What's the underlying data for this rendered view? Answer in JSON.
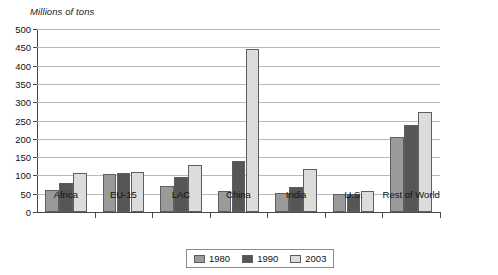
{
  "chart_data": {
    "type": "bar",
    "title": "",
    "subtitle": "",
    "xlabel": "",
    "ylabel": "Millions of tons",
    "ylim": [
      0,
      500
    ],
    "ytick_step": 50,
    "yticks": [
      0,
      50,
      100,
      150,
      200,
      250,
      300,
      350,
      400,
      450,
      500
    ],
    "ytick_labels": [
      "0",
      "50",
      "100",
      "150",
      "200",
      "250",
      "300",
      "350",
      "400",
      "450",
      "500"
    ],
    "grid": true,
    "grid_axis": "y",
    "legend_position": "bottom-center",
    "categories": [
      "Africa",
      "EU-15",
      "LAC",
      "China",
      "India",
      "U.S.",
      "Rest of World"
    ],
    "series": [
      {
        "name": "1980",
        "color": "#9a9a9a",
        "values": [
          60,
          105,
          72,
          57,
          52,
          48,
          205
        ]
      },
      {
        "name": "1990",
        "color": "#565656",
        "values": [
          79,
          107,
          96,
          140,
          67,
          49,
          237
        ]
      },
      {
        "name": "2003",
        "color": "#dcdcdc",
        "values": [
          107,
          109,
          128,
          445,
          118,
          57,
          272
        ]
      }
    ]
  },
  "legend": {
    "entries": [
      {
        "label": "1980",
        "color": "#9a9a9a"
      },
      {
        "label": "1990",
        "color": "#565656"
      },
      {
        "label": "2003",
        "color": "#dcdcdc"
      }
    ]
  },
  "colors": {
    "axis": "#4a4a4a",
    "grid": "#b9b9b9",
    "bar_border": "#5e5e5e",
    "text": "#111111",
    "background": "#ffffff"
  }
}
